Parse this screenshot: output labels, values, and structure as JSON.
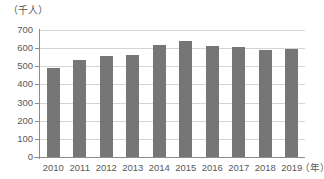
{
  "chart_data": {
    "type": "bar",
    "title": "",
    "subtitle": "",
    "xlabel": "（年）",
    "ylabel": "（千人）",
    "categories": [
      "2010",
      "2011",
      "2012",
      "2013",
      "2014",
      "2015",
      "2016",
      "2017",
      "2018",
      "2019"
    ],
    "values": [
      493,
      537,
      557,
      562,
      617,
      638,
      610,
      605,
      592,
      595
    ],
    "series": [
      {
        "name": "",
        "values": [
          493,
          537,
          557,
          562,
          617,
          638,
          610,
          605,
          592,
          595
        ]
      }
    ],
    "ylim": [
      0,
      700
    ],
    "yticks": [
      0,
      100,
      200,
      300,
      400,
      500,
      600,
      700
    ],
    "ytick_labels": [
      "0",
      "100",
      "200",
      "300",
      "400",
      "500",
      "600",
      "700"
    ],
    "grid": true,
    "legend": "none",
    "bar_color": "#767676",
    "gridline_color": "#d4d4d4",
    "axis_color": "#8c8c8c",
    "text_color": "#595959"
  }
}
